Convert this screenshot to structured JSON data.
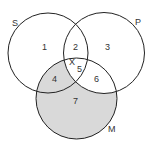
{
  "diagram": {
    "type": "venn",
    "sets": [
      {
        "name": "S",
        "cx": 48,
        "cy": 53,
        "r": 40
      },
      {
        "name": "P",
        "cx": 104,
        "cy": 53,
        "r": 40.5
      },
      {
        "name": "M",
        "cx": 76.5,
        "cy": 98.5,
        "r": 40.5
      }
    ],
    "set_labels": {
      "S": "S",
      "P": "P",
      "M": "M"
    },
    "regions": {
      "r1": "1",
      "r2": "2",
      "r3": "3",
      "r4": "4",
      "r5": "5",
      "r6": "6",
      "r7": "7",
      "x": "X"
    },
    "shaded_regions": [
      "4",
      "7"
    ],
    "colors": {
      "stroke": "#222222",
      "shade": "#d9d9d9",
      "background": "#ffffff"
    }
  }
}
